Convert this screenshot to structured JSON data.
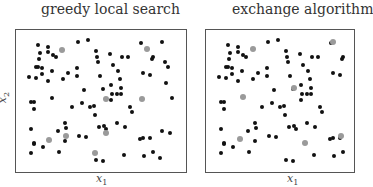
{
  "chart_data": [
    {
      "type": "scatter",
      "title": "greedy local search",
      "xlabel": "x1",
      "ylabel": "x2",
      "grid": false,
      "frame": {
        "left": 15,
        "top": 29,
        "right": 186,
        "bottom": 172
      },
      "series": [
        {
          "name": "candidate points",
          "color": "#111111",
          "points": [
            [
              38,
              45
            ],
            [
              40,
              53
            ],
            [
              48,
              47
            ],
            [
              48,
              52
            ],
            [
              53,
              55
            ],
            [
              56,
              57
            ],
            [
              39,
              59
            ],
            [
              36,
              67
            ],
            [
              38,
              67
            ],
            [
              42,
              68
            ],
            [
              52,
              71
            ],
            [
              29,
              77
            ],
            [
              36,
              78
            ],
            [
              42,
              74
            ],
            [
              48,
              81
            ],
            [
              63,
              79
            ],
            [
              68,
              73
            ],
            [
              77,
              68
            ],
            [
              77,
              76
            ],
            [
              78,
              42
            ],
            [
              88,
              40
            ],
            [
              96,
              51
            ],
            [
              97,
              57
            ],
            [
              98,
              62
            ],
            [
              110,
              54
            ],
            [
              113,
              65
            ],
            [
              118,
              71
            ],
            [
              122,
              57
            ],
            [
              128,
              57
            ],
            [
              100,
              76
            ],
            [
              120,
              79
            ],
            [
              84,
              90
            ],
            [
              103,
              89
            ],
            [
              111,
              85
            ],
            [
              121,
              88
            ],
            [
              141,
              43
            ],
            [
              152,
              59
            ],
            [
              153,
              57
            ],
            [
              162,
              42
            ],
            [
              143,
              73
            ],
            [
              150,
              75
            ],
            [
              165,
              62
            ],
            [
              168,
              67
            ],
            [
              166,
              83
            ],
            [
              31,
              102
            ],
            [
              34,
              102
            ],
            [
              34,
              109
            ],
            [
              52,
              98
            ],
            [
              72,
              107
            ],
            [
              82,
              103
            ],
            [
              90,
              107
            ],
            [
              94,
              106
            ],
            [
              95,
              115
            ],
            [
              65,
              123
            ],
            [
              66,
              128
            ],
            [
              31,
              129
            ],
            [
              58,
              131
            ],
            [
              34,
              143
            ],
            [
              34,
              144
            ],
            [
              43,
              147
            ],
            [
              65,
              141
            ],
            [
              79,
              136
            ],
            [
              86,
              137
            ],
            [
              99,
              127
            ],
            [
              106,
              129
            ],
            [
              104,
              126
            ],
            [
              117,
              123
            ],
            [
              125,
              127
            ],
            [
              132,
              112
            ],
            [
              130,
              107
            ],
            [
              111,
              100
            ],
            [
              121,
              94
            ],
            [
              31,
              153
            ],
            [
              59,
              152
            ],
            [
              96,
              160
            ],
            [
              103,
              161
            ],
            [
              124,
              155
            ],
            [
              140,
              139
            ],
            [
              143,
              138
            ],
            [
              150,
              138
            ],
            [
              162,
              131
            ],
            [
              170,
              133
            ],
            [
              144,
              156
            ],
            [
              153,
              152
            ],
            [
              160,
              158
            ],
            [
              172,
              98
            ],
            [
              112,
              94
            ],
            [
              117,
              94
            ]
          ]
        },
        {
          "name": "selected design",
          "color": "#9a9a9a",
          "points": [
            [
              62,
              50
            ],
            [
              147,
              49
            ],
            [
              49,
              140
            ],
            [
              66,
              136
            ],
            [
              95,
              153
            ],
            [
              106,
              133
            ],
            [
              106,
              99
            ],
            [
              142,
              99
            ]
          ]
        }
      ]
    },
    {
      "type": "scatter",
      "title": "exchange algorithm",
      "xlabel": "x1",
      "ylabel": "",
      "grid": false,
      "frame": {
        "left": 205,
        "top": 29,
        "right": 352,
        "bottom": 172
      },
      "series": [
        {
          "name": "candidate points",
          "color": "#111111",
          "offset_x": 190,
          "points": [
            [
              38,
              45
            ],
            [
              40,
              53
            ],
            [
              48,
              47
            ],
            [
              48,
              52
            ],
            [
              53,
              55
            ],
            [
              56,
              57
            ],
            [
              39,
              59
            ],
            [
              36,
              67
            ],
            [
              38,
              67
            ],
            [
              42,
              68
            ],
            [
              52,
              71
            ],
            [
              29,
              77
            ],
            [
              36,
              78
            ],
            [
              42,
              74
            ],
            [
              48,
              81
            ],
            [
              63,
              79
            ],
            [
              68,
              73
            ],
            [
              77,
              68
            ],
            [
              77,
              76
            ],
            [
              78,
              42
            ],
            [
              88,
              40
            ],
            [
              96,
              51
            ],
            [
              97,
              57
            ],
            [
              98,
              62
            ],
            [
              110,
              54
            ],
            [
              113,
              65
            ],
            [
              118,
              71
            ],
            [
              122,
              57
            ],
            [
              128,
              57
            ],
            [
              100,
              76
            ],
            [
              120,
              79
            ],
            [
              84,
              90
            ],
            [
              103,
              89
            ],
            [
              111,
              85
            ],
            [
              121,
              88
            ],
            [
              141,
              43
            ],
            [
              152,
              59
            ],
            [
              153,
              57
            ],
            [
              143,
              73
            ],
            [
              150,
              75
            ],
            [
              31,
              102
            ],
            [
              34,
              102
            ],
            [
              34,
              109
            ],
            [
              72,
              107
            ],
            [
              82,
              103
            ],
            [
              90,
              107
            ],
            [
              94,
              106
            ],
            [
              95,
              115
            ],
            [
              65,
              123
            ],
            [
              66,
              128
            ],
            [
              31,
              129
            ],
            [
              58,
              131
            ],
            [
              34,
              143
            ],
            [
              34,
              144
            ],
            [
              43,
              147
            ],
            [
              65,
              141
            ],
            [
              79,
              136
            ],
            [
              86,
              137
            ],
            [
              99,
              127
            ],
            [
              106,
              129
            ],
            [
              104,
              126
            ],
            [
              117,
              123
            ],
            [
              125,
              127
            ],
            [
              132,
              112
            ],
            [
              130,
              107
            ],
            [
              111,
              100
            ],
            [
              121,
              94
            ],
            [
              31,
              153
            ],
            [
              59,
              152
            ],
            [
              96,
              160
            ],
            [
              103,
              161
            ],
            [
              124,
              155
            ],
            [
              140,
              139
            ],
            [
              143,
              138
            ],
            [
              150,
              138
            ],
            [
              144,
              156
            ],
            [
              153,
              152
            ],
            [
              112,
              94
            ],
            [
              117,
              94
            ]
          ]
        },
        {
          "name": "selected design",
          "color": "#9a9a9a",
          "offset_x": 0,
          "points": [
            [
              253,
              49
            ],
            [
              333,
              42
            ],
            [
              294,
              88
            ],
            [
              243,
              97
            ],
            [
              240,
              139
            ],
            [
              305,
              143
            ],
            [
              341,
              136
            ]
          ]
        }
      ]
    }
  ],
  "labels": {
    "left_title": "greedy local search",
    "right_title": "exchange algorithm",
    "x_var": "x",
    "x_sub": "1",
    "y_var": "x",
    "y_sub": "2"
  }
}
